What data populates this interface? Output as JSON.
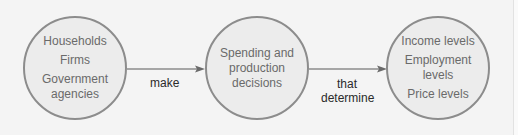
{
  "diagram": {
    "type": "flow",
    "direction": "left-to-right",
    "colors": {
      "background": "#f4f4f4",
      "node_fill": "#ececec",
      "node_stroke": "#8c8c8c",
      "node_text": "#6a6a6a",
      "connector_stroke": "#8c8c8c",
      "connector_text": "#2a2a2a"
    },
    "nodes": [
      {
        "id": "economic-actors",
        "lines": [
          "Households",
          "Firms",
          "Government",
          "agencies"
        ]
      },
      {
        "id": "decisions",
        "lines": [
          "Spending and",
          "production",
          "decisions"
        ]
      },
      {
        "id": "outcomes",
        "lines": [
          "Income levels",
          "Employment",
          "levels",
          "Price levels"
        ]
      }
    ],
    "edges": [
      {
        "from": "economic-actors",
        "to": "decisions",
        "label_lines": [
          "make"
        ]
      },
      {
        "from": "decisions",
        "to": "outcomes",
        "label_lines": [
          "that",
          "determine"
        ]
      }
    ]
  }
}
